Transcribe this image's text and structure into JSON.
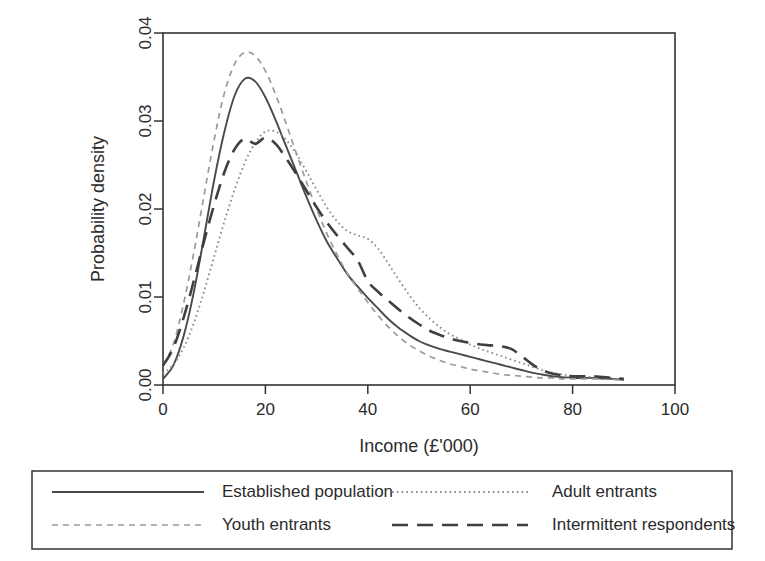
{
  "chart_data": {
    "type": "line",
    "title": "",
    "xlabel": "Income (£'000)",
    "ylabel": "Probability density",
    "xlim": [
      0,
      100
    ],
    "ylim": [
      0,
      0.04
    ],
    "xticks": [
      0,
      20,
      40,
      60,
      80,
      100
    ],
    "xtick_labels": [
      "0",
      "20",
      "40",
      "60",
      "80",
      "100"
    ],
    "yticks": [
      0.0,
      0.01,
      0.02,
      0.03,
      0.04
    ],
    "ytick_labels": [
      "0.00",
      "0.01",
      "0.02",
      "0.03",
      "0.04"
    ],
    "grid": false,
    "legend_position": "below-plot",
    "x": [
      0,
      2,
      4,
      6,
      8,
      10,
      12,
      14,
      16,
      18,
      20,
      22,
      24,
      26,
      28,
      30,
      32,
      34,
      36,
      38,
      40,
      42,
      44,
      46,
      48,
      50,
      52,
      54,
      56,
      58,
      60,
      62,
      64,
      66,
      68,
      70,
      72,
      74,
      76,
      78,
      80,
      82,
      84,
      86,
      88,
      90
    ],
    "series": [
      {
        "name": "Established population",
        "linestyle": "solid",
        "color": "#4a4a4a",
        "values": [
          0.0007,
          0.0022,
          0.0055,
          0.0105,
          0.0168,
          0.0233,
          0.0288,
          0.0329,
          0.0348,
          0.0345,
          0.0327,
          0.0301,
          0.0272,
          0.0243,
          0.0214,
          0.0187,
          0.0163,
          0.0144,
          0.0126,
          0.0112,
          0.0099,
          0.0087,
          0.0075,
          0.0065,
          0.0057,
          0.005,
          0.0045,
          0.0041,
          0.0038,
          0.0035,
          0.0032,
          0.0029,
          0.0026,
          0.0023,
          0.002,
          0.0017,
          0.0014,
          0.0012,
          0.001,
          0.0009,
          0.0008,
          0.0008,
          0.0008,
          0.0007,
          0.0007,
          0.0006
        ]
      },
      {
        "name": "Youth entrants",
        "linestyle": "dashed-short",
        "color": "#9a9a9a",
        "values": [
          0.0023,
          0.0046,
          0.0092,
          0.015,
          0.0215,
          0.0279,
          0.0332,
          0.0365,
          0.0378,
          0.0374,
          0.0357,
          0.033,
          0.0298,
          0.0264,
          0.0231,
          0.02,
          0.0172,
          0.0148,
          0.0127,
          0.011,
          0.0094,
          0.0079,
          0.0066,
          0.0055,
          0.0046,
          0.0039,
          0.0033,
          0.0028,
          0.0024,
          0.0021,
          0.0018,
          0.0016,
          0.0014,
          0.0012,
          0.0011,
          0.001,
          0.0009,
          0.0008,
          0.0008,
          0.0007,
          0.0007,
          0.0007,
          0.0007,
          0.0007,
          0.0006,
          0.0006
        ]
      },
      {
        "name": "Adult entrants",
        "linestyle": "dotted",
        "color": "#8a8a8a",
        "values": [
          0.0013,
          0.0023,
          0.0042,
          0.007,
          0.0106,
          0.0146,
          0.0186,
          0.0222,
          0.0253,
          0.0275,
          0.0288,
          0.0288,
          0.0279,
          0.0263,
          0.0243,
          0.0222,
          0.0202,
          0.0186,
          0.0175,
          0.017,
          0.0166,
          0.0155,
          0.0138,
          0.012,
          0.0103,
          0.0088,
          0.0076,
          0.0066,
          0.0058,
          0.0052,
          0.0046,
          0.0041,
          0.0037,
          0.0033,
          0.0029,
          0.0025,
          0.0021,
          0.0017,
          0.0014,
          0.0012,
          0.001,
          0.0009,
          0.0009,
          0.0008,
          0.0007,
          0.0006
        ]
      },
      {
        "name": "Intermittent respondents",
        "linestyle": "dashed-long",
        "color": "#3f3f3f",
        "values": [
          0.0022,
          0.0042,
          0.0076,
          0.0118,
          0.0163,
          0.0205,
          0.0242,
          0.0268,
          0.028,
          0.0274,
          0.0281,
          0.0274,
          0.0258,
          0.024,
          0.0221,
          0.0202,
          0.0185,
          0.017,
          0.0156,
          0.0142,
          0.0118,
          0.0106,
          0.0096,
          0.0086,
          0.0077,
          0.0069,
          0.0062,
          0.0057,
          0.0053,
          0.005,
          0.0048,
          0.0046,
          0.0045,
          0.0044,
          0.0041,
          0.0033,
          0.0024,
          0.0017,
          0.0013,
          0.0011,
          0.001,
          0.001,
          0.001,
          0.0009,
          0.0008,
          0.0007
        ]
      }
    ],
    "legend_entries": [
      {
        "label": "Established population",
        "linestyle": "solid",
        "color": "#4a4a4a"
      },
      {
        "label": "Adult entrants",
        "linestyle": "dotted",
        "color": "#8a8a8a"
      },
      {
        "label": "Youth entrants",
        "linestyle": "dashed-short",
        "color": "#9a9a9a"
      },
      {
        "label": "Intermittent respondents",
        "linestyle": "dashed-long",
        "color": "#3f3f3f"
      }
    ]
  }
}
